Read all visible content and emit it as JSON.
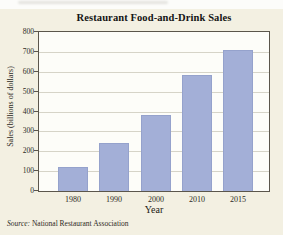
{
  "figure": {
    "title": "Restaurant Food-and-Drink Sales",
    "source_prefix": "Source:",
    "source_text": " National Restaurant Association",
    "colors": {
      "card_background": "#f3f0e2",
      "plot_background": "#fdfdf9",
      "bar_fill": "#a3afd7",
      "bar_border": "#95a2cc",
      "gridline": "#d6d4c8",
      "plot_border": "#5b564c",
      "text": "#2e2a24"
    }
  },
  "chart_data": {
    "type": "bar",
    "title": "Restaurant Food-and-Drink Sales",
    "categories": [
      "1980",
      "1990",
      "2000",
      "2010",
      "2015"
    ],
    "values": [
      120,
      240,
      380,
      585,
      710
    ],
    "xlabel": "Year",
    "ylabel": "Sales (billions of dollars)",
    "ylim": [
      0,
      800
    ],
    "yticks": [
      0,
      100,
      200,
      300,
      400,
      500,
      600,
      700,
      800
    ],
    "grid": "horizontal",
    "legend": "none",
    "bar_color": "#a3afd7",
    "source": "Source: National Restaurant Association"
  }
}
